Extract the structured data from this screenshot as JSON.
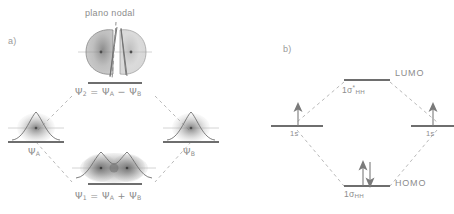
{
  "figure": {
    "type": "molecular-orbital-diagram",
    "language": "pt",
    "panels": [
      {
        "id": "a",
        "label": "a)"
      },
      {
        "id": "b",
        "label": "b)"
      }
    ]
  },
  "panel_a": {
    "panel_label": "a)",
    "nodal_plane_label": "plano nodal",
    "levels": [
      {
        "name": "antibonding",
        "label_full": "Ψ₂ = Ψₐ − Ψᵦ",
        "psi": "Ψ",
        "psi_index": "2",
        "eq": "=",
        "term_a": "Ψ",
        "term_a_sub": "A",
        "operator": "−",
        "term_b": "Ψ",
        "term_b_sub": "B",
        "position": "top-center",
        "orbital_style": "two-lobes-with-node"
      },
      {
        "name": "atomic-a",
        "label_full": "Ψₐ",
        "psi": "Ψ",
        "psi_sub": "A",
        "position": "middle-left",
        "orbital_style": "single-s-orbital"
      },
      {
        "name": "atomic-b",
        "label_full": "Ψᵦ",
        "psi": "Ψ",
        "psi_sub": "B",
        "position": "middle-right",
        "orbital_style": "single-s-orbital"
      },
      {
        "name": "bonding",
        "label_full": "Ψ₁ = Ψₐ + Ψᵦ",
        "psi": "Ψ",
        "psi_index": "1",
        "eq": "=",
        "term_a": "Ψ",
        "term_a_sub": "A",
        "operator": "+",
        "term_b": "Ψ",
        "term_b_sub": "B",
        "position": "bottom-center",
        "orbital_style": "merged-sigma-orbital"
      }
    ]
  },
  "panel_b": {
    "panel_label": "b)",
    "levels": [
      {
        "name": "antibonding-mo",
        "symbol": "1σ",
        "superscript": "*",
        "subscript": "HH",
        "annotation": "LUMO",
        "electrons": 0,
        "position": "top-center"
      },
      {
        "name": "atomic-left",
        "symbol": "1s",
        "superscript": "",
        "subscript": "",
        "annotation": "",
        "electrons": 1,
        "spin": "up",
        "position": "middle-left"
      },
      {
        "name": "atomic-right",
        "symbol": "1s",
        "superscript": "",
        "subscript": "",
        "annotation": "",
        "electrons": 1,
        "spin": "up",
        "position": "middle-right"
      },
      {
        "name": "bonding-mo",
        "symbol": "1σ",
        "superscript": "",
        "subscript": "HH",
        "annotation": "HOMO",
        "electrons": 2,
        "spin": "up-down",
        "position": "bottom-center"
      }
    ]
  },
  "colors": {
    "level_line": "#6e6e6e",
    "correlation_dash": "#b9b9b9",
    "text": "#8c8c8c",
    "nodal_dash": "#8f8f8f",
    "orbital_fill": "#9c9c9c"
  }
}
